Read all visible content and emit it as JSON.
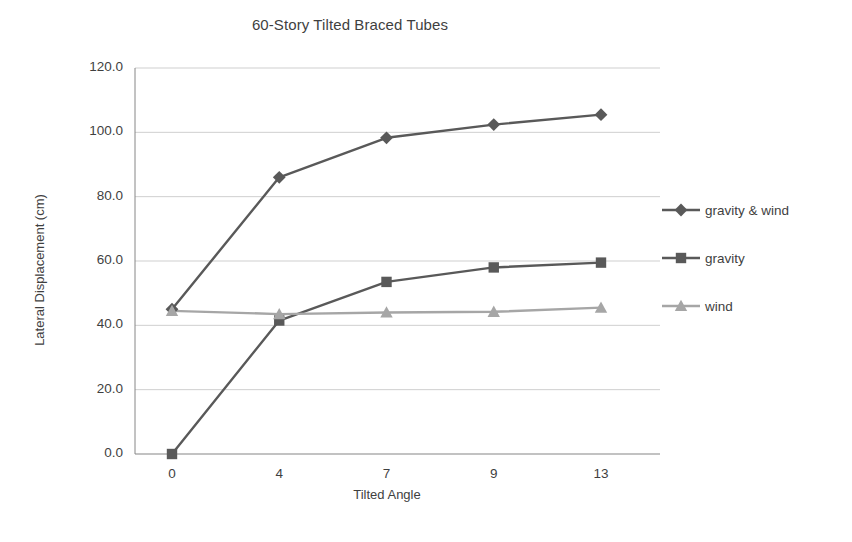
{
  "chart_data": {
    "type": "line",
    "title": "60-Story Tilted Braced Tubes",
    "xlabel": "Tilted Angle",
    "ylabel": "Lateral Displacement (cm)",
    "categories": [
      "0",
      "4",
      "7",
      "9",
      "13"
    ],
    "ylim": [
      0,
      120
    ],
    "ytick_labels": [
      "0.0",
      "20.0",
      "40.0",
      "60.0",
      "80.0",
      "100.0",
      "120.0"
    ],
    "ytick_values": [
      0,
      20,
      40,
      60,
      80,
      100,
      120
    ],
    "grid": "horizontal",
    "legend_position": "right",
    "series": [
      {
        "name": "gravity & wind",
        "marker": "diamond",
        "color": "#595959",
        "values": [
          45.0,
          86.0,
          98.3,
          102.4,
          105.5
        ]
      },
      {
        "name": "gravity",
        "marker": "square",
        "color": "#595959",
        "values": [
          0.0,
          41.5,
          53.5,
          58.0,
          59.5
        ]
      },
      {
        "name": "wind",
        "marker": "triangle",
        "color": "#a6a6a6",
        "values": [
          44.5,
          43.5,
          44.0,
          44.2,
          45.5
        ]
      }
    ]
  },
  "colors": {
    "axis": "#868686",
    "gridline": "#cfcfcf",
    "text": "#3f3f3f",
    "series_dark": "#595959",
    "series_light": "#a6a6a6",
    "background": "#ffffff"
  }
}
